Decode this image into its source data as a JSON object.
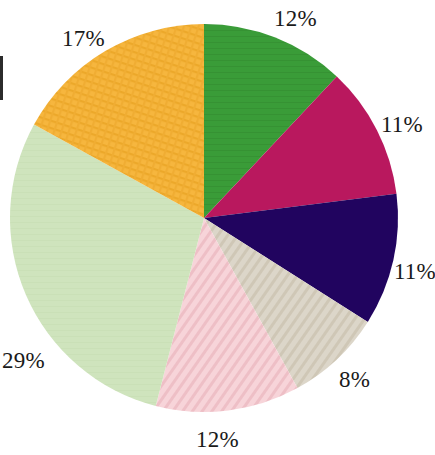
{
  "chart_data": {
    "type": "pie",
    "title": "",
    "subtitle": "",
    "xlabel": "",
    "ylabel": "",
    "legend": "none",
    "grid": false,
    "labels_shown": "percentage",
    "start_angle_deg": 0,
    "direction": "clockwise",
    "categories": [
      "Segment 1",
      "Segment 2",
      "Segment 3",
      "Segment 4",
      "Segment 5",
      "Segment 6",
      "Segment 7"
    ],
    "values": [
      12,
      11,
      11,
      8,
      12,
      29,
      17
    ],
    "value_labels": [
      "12%",
      "11%",
      "11%",
      "8%",
      "12%",
      "29%",
      "17%"
    ],
    "colors": [
      "#3a9c38",
      "#b9185e",
      "#21045f",
      "#d9d2c4",
      "#f4cbd1",
      "#cfe4bd",
      "#f4b238"
    ],
    "textures": [
      "solid",
      "solid",
      "solid",
      "diagonal-stripe",
      "diagonal-stripe",
      "solid",
      "crosshatch"
    ],
    "total": 100
  },
  "geometry": {
    "center_x": 204,
    "center_y": 218,
    "radius": 194
  },
  "labels": {
    "top": "12%",
    "right_upper": "11%",
    "right_lower": "11%",
    "lower_right": "8%",
    "bottom": "12%",
    "left": "29%",
    "upper_left": "17%"
  },
  "palette": {
    "background": "#ffffff",
    "text": "#1a1a1a",
    "green": "#3a9c38",
    "magenta": "#b9185e",
    "navy": "#21045f",
    "beige": "#d9d2c4",
    "pink": "#f4cbd1",
    "light_green": "#cfe4bd",
    "amber": "#f4b238"
  }
}
